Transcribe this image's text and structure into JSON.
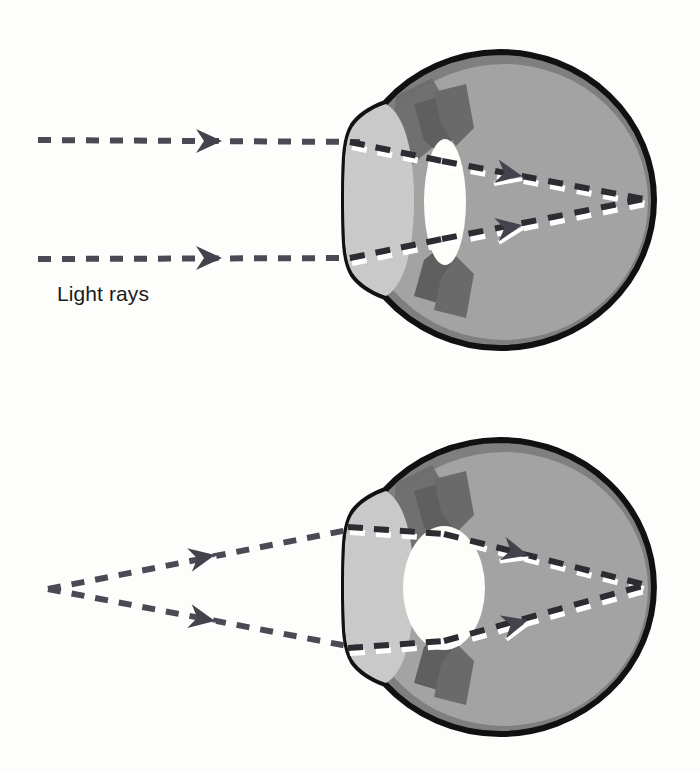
{
  "figure": {
    "background_color": "#fdfdfc",
    "labels": {
      "light_rays": "Light rays"
    },
    "palette": {
      "outline": "#111111",
      "sclera_rim": "#7f7f7f",
      "vitreous": "#a3a3a3",
      "cornea": "#c9c9c9",
      "aqueous": "#b4b4b4",
      "iris": "#6e6e6e",
      "lens": "#fdfdfa",
      "ray": "#4a4a55",
      "ray_highlight": "#ffffff"
    },
    "panels": [
      {
        "name": "distant-vision",
        "description": "Parallel light rays from a distant object entering a relaxed eye with a thin flat lens",
        "ray_type": "parallel",
        "lens_shape": "thin",
        "eye": {
          "cx": 500,
          "cy": 200,
          "rx": 154,
          "ry": 148
        },
        "lens": {
          "cx": 445,
          "cy": 202,
          "rx": 21,
          "ry": 63
        },
        "rays": [
          {
            "name": "upper-ray",
            "start_x": 38,
            "start_y": 140,
            "entry_x": 360,
            "entry_y": 142,
            "focus_x": 641,
            "focus_y": 199,
            "arrow_outside_x": 212,
            "arrow_inside_x": 508
          },
          {
            "name": "lower-ray",
            "start_x": 38,
            "start_y": 259,
            "entry_x": 360,
            "entry_y": 258,
            "focus_x": 641,
            "focus_y": 199,
            "arrow_outside_x": 212,
            "arrow_inside_x": 508
          }
        ],
        "focal_point": {
          "x": 641,
          "y": 199
        }
      },
      {
        "name": "near-vision",
        "description": "Diverging light rays from a near point source entering an accommodated eye with a thick rounded lens",
        "ray_type": "diverging",
        "lens_shape": "thick",
        "eye": {
          "cx": 500,
          "cy": 587,
          "rx": 154,
          "ry": 147
        },
        "lens": {
          "cx": 444,
          "cy": 588,
          "rx": 41,
          "ry": 62
        },
        "point_source": {
          "x": 48,
          "y": 589
        },
        "rays": [
          {
            "name": "upper-ray",
            "start_x": 48,
            "start_y": 589,
            "entry_x": 358,
            "entry_y": 528,
            "focus_x": 641,
            "focus_y": 585,
            "arrow_outside_x": 205,
            "arrow_inside_x": 512
          },
          {
            "name": "lower-ray",
            "start_x": 48,
            "start_y": 589,
            "entry_x": 358,
            "entry_y": 648,
            "focus_x": 641,
            "focus_y": 585,
            "arrow_outside_x": 205,
            "arrow_inside_x": 512
          }
        ],
        "focal_point": {
          "x": 641,
          "y": 585
        }
      }
    ]
  }
}
